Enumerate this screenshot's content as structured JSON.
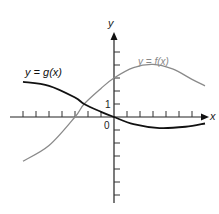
{
  "chart_data": {
    "type": "line",
    "title": "",
    "xlabel": "x",
    "ylabel": "y",
    "tick_labels": {
      "origin": "0",
      "y_unit": "1"
    },
    "grid": false,
    "axis_ranges": {
      "x": [
        -8.5,
        7.5
      ],
      "y": [
        -6.6,
        6.4
      ]
    },
    "x_ticks": [
      -7,
      -6,
      -5,
      -4,
      -3,
      -2,
      -1,
      1,
      2,
      3,
      4,
      5,
      6
    ],
    "y_ticks": [
      -6,
      -5,
      -4,
      -3,
      -2,
      -1,
      1,
      2,
      3,
      4,
      5
    ],
    "series": [
      {
        "name": "y = f(x)",
        "color": "#8a8a8a",
        "points": [
          [
            -7,
            -3.4
          ],
          [
            -5,
            -2.2
          ],
          [
            -3,
            0
          ],
          [
            -2.3,
            1.0
          ],
          [
            -1,
            2.2
          ],
          [
            0,
            3.0
          ],
          [
            1.5,
            3.8
          ],
          [
            3,
            4.05
          ],
          [
            4.5,
            3.7
          ],
          [
            6,
            2.9
          ],
          [
            7,
            2.4
          ]
        ]
      },
      {
        "name": "y = g(x)",
        "color": "#111111",
        "points": [
          [
            -7,
            2.7
          ],
          [
            -5,
            2.4
          ],
          [
            -3,
            1.5
          ],
          [
            -2.3,
            1.0
          ],
          [
            -1,
            0.4
          ],
          [
            0,
            0
          ],
          [
            1.5,
            -0.55
          ],
          [
            3.5,
            -0.85
          ],
          [
            5.5,
            -0.75
          ],
          [
            7,
            -0.5
          ]
        ]
      }
    ],
    "annotations": [
      "y = g(x)",
      "y = f(x)",
      "0",
      "1",
      "x",
      "y"
    ]
  },
  "labels": {
    "g_label": "y = g(x)",
    "f_label": "y = f(x)",
    "x_axis": "x",
    "y_axis": "y",
    "origin": "0",
    "one": "1"
  }
}
